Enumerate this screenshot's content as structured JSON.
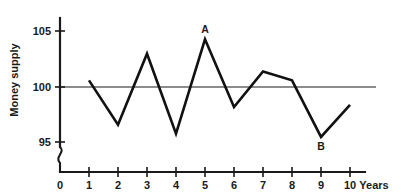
{
  "chart_data": {
    "type": "line",
    "title": "",
    "xlabel": "Years",
    "ylabel": "Money supply",
    "x": [
      1,
      2,
      3,
      4,
      5,
      6,
      7,
      8,
      9,
      10
    ],
    "values": [
      100.6,
      96.6,
      103.0,
      95.8,
      104.3,
      98.2,
      101.4,
      100.6,
      95.5,
      98.4
    ],
    "xticks": [
      "0",
      "1",
      "2",
      "3",
      "4",
      "5",
      "6",
      "7",
      "8",
      "9",
      "10"
    ],
    "yticks": [
      "95",
      "100",
      "105"
    ],
    "ylim": [
      95,
      105
    ],
    "xlim": [
      0,
      10
    ],
    "grid": false,
    "legend": null,
    "reference_line": {
      "value": 100,
      "color": "#8c8c8c",
      "orientation": "horizontal"
    },
    "axis_break": {
      "axis": "y",
      "between": [
        0,
        95
      ],
      "symbol": "squiggle"
    },
    "annotations": [
      {
        "label": "A",
        "x": 5,
        "y": 104.3,
        "position": "above"
      },
      {
        "label": "B",
        "x": 9,
        "y": 95.5,
        "position": "below"
      }
    ],
    "series_color": "#111111"
  },
  "labels": {
    "y_axis_title": "Money supply",
    "x_axis_title": "Years",
    "y_tick_105": "105",
    "y_tick_100": "100",
    "y_tick_95": "95",
    "x_tick_0": "0",
    "x_tick_1": "1",
    "x_tick_2": "2",
    "x_tick_3": "3",
    "x_tick_4": "4",
    "x_tick_5": "5",
    "x_tick_6": "6",
    "x_tick_7": "7",
    "x_tick_8": "8",
    "x_tick_9": "9",
    "x_tick_10": "10",
    "point_a": "A",
    "point_b": "B"
  }
}
